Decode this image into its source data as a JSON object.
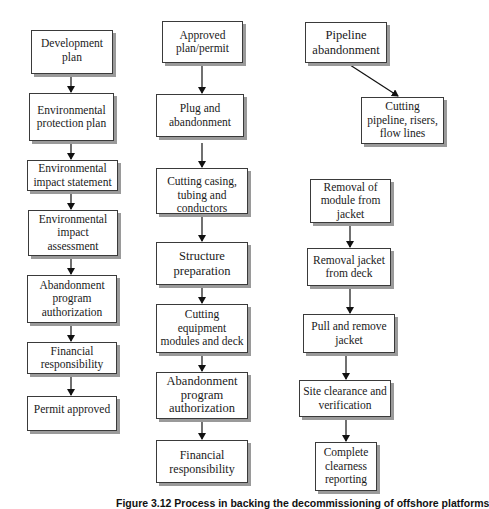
{
  "diagram": {
    "type": "flowchart",
    "columns": [
      {
        "name": "regulatory-approval",
        "nodes": [
          {
            "id": "c1n1",
            "label": "Development\nplan"
          },
          {
            "id": "c1n2",
            "label": "Environmental\nprotection plan"
          },
          {
            "id": "c1n3",
            "label": "Environmental\nimpact statement"
          },
          {
            "id": "c1n4",
            "label": "Environmental\nimpact\nassessment"
          },
          {
            "id": "c1n5",
            "label": "Abandonment\nprogram\nauthorization"
          },
          {
            "id": "c1n6",
            "label": "Financial\nresponsibility"
          },
          {
            "id": "c1n7",
            "label": "Permit approved"
          }
        ]
      },
      {
        "name": "well-and-structure",
        "nodes": [
          {
            "id": "c2n1",
            "label": "Approved\nplan/permit"
          },
          {
            "id": "c2n2",
            "label": "Plug and\nabandonment"
          },
          {
            "id": "c2n3",
            "label": "Cutting casing,\ntubing and\nconductors"
          },
          {
            "id": "c2n4",
            "label": "Structure\npreparation"
          },
          {
            "id": "c2n5",
            "label": "Cutting\nequipment\nmodules and deck"
          },
          {
            "id": "c2n6",
            "label": "Abandonment\nprogram\nauthorization"
          },
          {
            "id": "c2n7",
            "label": "Financial\nresponsibility"
          }
        ]
      },
      {
        "name": "pipeline-and-jacket",
        "nodes": [
          {
            "id": "c3n1",
            "label": "Pipeline\nabandonment"
          },
          {
            "id": "c3n2",
            "label": "Cutting\npipeline, risers,\nflow lines"
          },
          {
            "id": "c3n3",
            "label": "Removal of\nmodule from\njacket"
          },
          {
            "id": "c3n4",
            "label": "Removal jacket\nfrom deck"
          },
          {
            "id": "c3n5",
            "label": "Pull and remove\njacket"
          },
          {
            "id": "c3n6",
            "label": "Site clearance and\nverification"
          },
          {
            "id": "c3n7",
            "label": "Complete\nclearness\nreporting"
          }
        ]
      }
    ],
    "edges": [
      [
        "c1n1",
        "c1n2"
      ],
      [
        "c1n2",
        "c1n3"
      ],
      [
        "c1n3",
        "c1n4"
      ],
      [
        "c1n4",
        "c1n5"
      ],
      [
        "c1n5",
        "c1n6"
      ],
      [
        "c1n6",
        "c1n7"
      ],
      [
        "c2n1",
        "c2n2"
      ],
      [
        "c2n2",
        "c2n3"
      ],
      [
        "c2n3",
        "c2n4"
      ],
      [
        "c2n4",
        "c2n5"
      ],
      [
        "c2n5",
        "c2n6"
      ],
      [
        "c2n6",
        "c2n7"
      ],
      [
        "c3n1",
        "c3n2"
      ],
      [
        "c3n3",
        "c3n4"
      ],
      [
        "c3n4",
        "c3n5"
      ],
      [
        "c3n5",
        "c3n6"
      ],
      [
        "c3n6",
        "c3n7"
      ]
    ],
    "colors": {
      "border": "#3a3a3a",
      "shadow": "#9a9a9a",
      "arrow": "#111111",
      "background": "#ffffff"
    }
  },
  "caption": "Figure 3.12   Process in backing the decommissioning of offshore platforms"
}
